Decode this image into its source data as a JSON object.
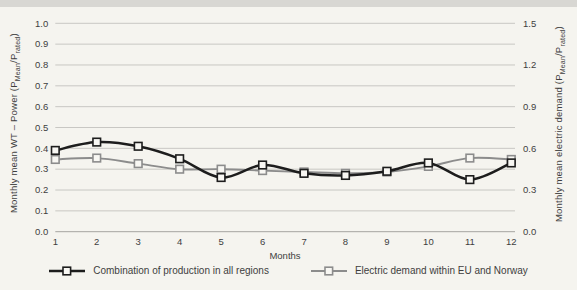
{
  "page": {
    "background_color": "#f5f4ef",
    "top_strip_color": "#d8d7d3"
  },
  "chart_data": {
    "type": "line",
    "x_categories": [
      "1",
      "2",
      "3",
      "4",
      "5",
      "6",
      "7",
      "8",
      "9",
      "10",
      "11",
      "12"
    ],
    "xlabel": "Months",
    "grid": true,
    "legend_position": "bottom",
    "left_axis": {
      "title": "Monthly mean WT – Power (P_{Mean}/P_{rated})",
      "min": 0.0,
      "max": 1.0,
      "tick_labels": [
        "1.0",
        "0.9",
        "0.8",
        "0.7",
        "0.6",
        "0.5",
        "0.4",
        "0.3",
        "0.2",
        "0.1",
        "0.0"
      ]
    },
    "right_axis": {
      "title": "Monthly mean electric demand (P_{Mean}/P_{rated})",
      "min": 0.0,
      "max": 1.5,
      "tick_labels": [
        "1.5",
        "1.2",
        "0.9",
        "0.6",
        "0.3",
        "0.0"
      ]
    },
    "series": [
      {
        "name": "Combination of production in all regions",
        "axis": "left",
        "color": "#1d1d1d",
        "line_width": 2.5,
        "marker": "open-square",
        "values": [
          0.39,
          0.43,
          0.41,
          0.35,
          0.26,
          0.32,
          0.28,
          0.27,
          0.29,
          0.33,
          0.25,
          0.33
        ]
      },
      {
        "name": "Electric demand within EU and Norway",
        "axis": "right",
        "color": "#8c8c8c",
        "line_width": 1.9,
        "marker": "open-square",
        "values": [
          0.52,
          0.53,
          0.49,
          0.45,
          0.45,
          0.44,
          0.43,
          0.42,
          0.43,
          0.47,
          0.53,
          0.52
        ]
      }
    ]
  }
}
